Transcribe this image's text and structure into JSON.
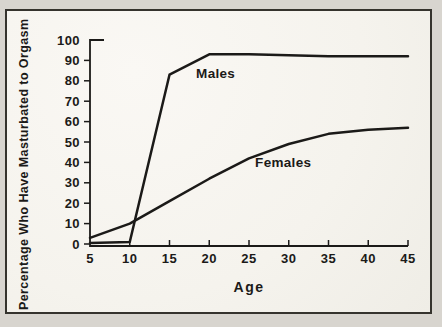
{
  "figure": {
    "paper_color": "#f7f5f0",
    "outer_color": "#d8d5cf",
    "ink_color": "#1b1a18",
    "frame_border_color": "#35332d"
  },
  "chart_data": {
    "type": "line",
    "x": [
      5,
      10,
      15,
      20,
      25,
      30,
      35,
      40,
      45
    ],
    "series": [
      {
        "name": "Males",
        "values": [
          0.5,
          1,
          83,
          93,
          93,
          92.5,
          92,
          92,
          92
        ]
      },
      {
        "name": "Females",
        "values": [
          3,
          10,
          21,
          32,
          42,
          49,
          54,
          56,
          57
        ]
      }
    ],
    "xlabel": "Age",
    "ylabel": "Percentage Who Have Masturbated to Orgasm",
    "xticks": [
      5,
      10,
      15,
      20,
      25,
      30,
      35,
      40,
      45
    ],
    "yticks": [
      0,
      10,
      20,
      30,
      40,
      50,
      60,
      70,
      80,
      90,
      100
    ],
    "xlim": [
      5,
      45
    ],
    "ylim": [
      0,
      100
    ],
    "grid": false,
    "legend_position": "inline-annotations",
    "annotations": [
      {
        "text": "Males",
        "x": 20.8,
        "y": 83.5
      },
      {
        "text": "Females",
        "x": 29.3,
        "y": 40
      }
    ]
  }
}
